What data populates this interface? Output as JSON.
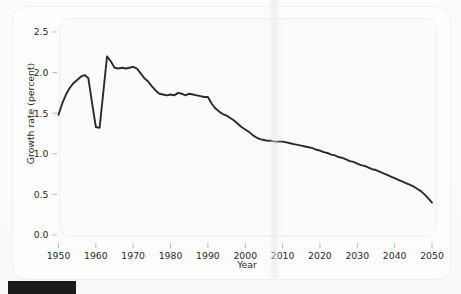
{
  "chart_data": {
    "type": "line",
    "title": "",
    "xlabel": "Year",
    "ylabel": "Growth rate (percent)",
    "xlim": [
      1950,
      2050
    ],
    "ylim": [
      0.0,
      2.5
    ],
    "grid": false,
    "legend": null,
    "xticks": [
      1950,
      1960,
      1970,
      1980,
      1990,
      2000,
      2010,
      2020,
      2030,
      2040,
      2050
    ],
    "xtick_labels": [
      "1950",
      "1960",
      "1970",
      "1980",
      "1990",
      "2000",
      "2010",
      "2020",
      "2030",
      "2040",
      "2050"
    ],
    "yticks": [
      0.0,
      0.5,
      1.0,
      1.5,
      2.0,
      2.5
    ],
    "ytick_labels": [
      "0.0",
      "0.5",
      "1.0",
      "1.5",
      "2.0",
      "2.5"
    ],
    "line_color": "#2b2b2b",
    "series": [
      {
        "name": "World population growth rate",
        "x": [
          1950,
          1951,
          1952,
          1953,
          1954,
          1955,
          1956,
          1957,
          1958,
          1959,
          1960,
          1961,
          1962,
          1963,
          1964,
          1965,
          1966,
          1967,
          1968,
          1969,
          1970,
          1971,
          1972,
          1973,
          1974,
          1975,
          1976,
          1977,
          1978,
          1979,
          1980,
          1981,
          1982,
          1983,
          1984,
          1985,
          1986,
          1987,
          1988,
          1989,
          1990,
          1991,
          1992,
          1993,
          1994,
          1995,
          1996,
          1997,
          1998,
          1999,
          2000,
          2001,
          2002,
          2003,
          2004,
          2005,
          2006,
          2007,
          2008,
          2009,
          2010,
          2011,
          2012,
          2013,
          2014,
          2015,
          2016,
          2017,
          2018,
          2019,
          2020,
          2021,
          2022,
          2023,
          2024,
          2025,
          2026,
          2027,
          2028,
          2029,
          2030,
          2031,
          2032,
          2033,
          2034,
          2035,
          2036,
          2037,
          2038,
          2039,
          2040,
          2041,
          2042,
          2043,
          2044,
          2045,
          2046,
          2047,
          2048,
          2049,
          2050
        ],
        "y": [
          1.48,
          1.62,
          1.73,
          1.81,
          1.87,
          1.91,
          1.95,
          1.97,
          1.93,
          1.62,
          1.33,
          1.32,
          1.76,
          2.2,
          2.14,
          2.06,
          2.05,
          2.06,
          2.05,
          2.06,
          2.07,
          2.05,
          1.99,
          1.93,
          1.89,
          1.83,
          1.78,
          1.74,
          1.73,
          1.72,
          1.73,
          1.72,
          1.75,
          1.74,
          1.72,
          1.74,
          1.73,
          1.72,
          1.71,
          1.7,
          1.7,
          1.62,
          1.56,
          1.52,
          1.49,
          1.47,
          1.44,
          1.41,
          1.37,
          1.33,
          1.3,
          1.27,
          1.23,
          1.2,
          1.18,
          1.17,
          1.16,
          1.16,
          1.15,
          1.15,
          1.15,
          1.14,
          1.13,
          1.12,
          1.11,
          1.1,
          1.09,
          1.08,
          1.07,
          1.05,
          1.04,
          1.02,
          1.01,
          0.99,
          0.98,
          0.96,
          0.95,
          0.93,
          0.91,
          0.9,
          0.88,
          0.86,
          0.85,
          0.83,
          0.81,
          0.8,
          0.78,
          0.76,
          0.74,
          0.72,
          0.7,
          0.68,
          0.66,
          0.64,
          0.62,
          0.6,
          0.57,
          0.54,
          0.5,
          0.45,
          0.4
        ]
      }
    ]
  },
  "axes": {
    "x_title": "Year",
    "y_title": "Growth rate (percent)"
  }
}
